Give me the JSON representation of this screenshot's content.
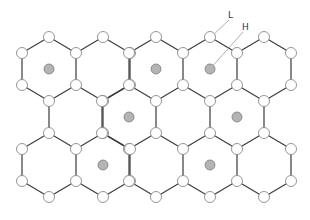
{
  "diagram": {
    "labels": [
      {
        "id": "L",
        "text": "L",
        "x": 228,
        "y": 18,
        "target": [
          211,
          37
        ]
      },
      {
        "id": "H",
        "text": "H",
        "x": 242,
        "y": 30,
        "target": [
          210,
          69
        ]
      }
    ],
    "colors": {
      "edge": "#3a3a3a",
      "node_fill": "#ffffff",
      "node_stroke": "#8a8a8a",
      "dot_fill": "#b4b4b4"
    },
    "hex": {
      "half_width": 27,
      "radius": 32,
      "node_radius": 5.5,
      "dot_radius": 5
    },
    "rows": [
      {
        "cy": 69,
        "centers": [
          49,
          103,
          156,
          210,
          264
        ],
        "occupied": [
          49,
          156,
          210
        ]
      },
      {
        "cy": 117,
        "centers": [
          76,
          129,
          183,
          237
        ],
        "occupied": [
          129,
          237
        ]
      },
      {
        "cy": 165,
        "centers": [
          49,
          103,
          156,
          210,
          264
        ],
        "occupied": [
          103,
          210
        ]
      }
    ]
  }
}
